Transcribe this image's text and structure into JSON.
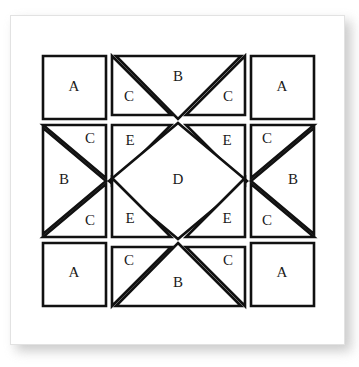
{
  "diagram": {
    "type": "quilt-block-pattern",
    "colors": {
      "background": "#ffffff",
      "page_background": "#ffffff",
      "piece_fill": "#ffffff",
      "piece_outline": "#111111",
      "label_text": "#1a1a1a",
      "card_border": "#e2e2e2",
      "shadow": "#b9b9b9"
    },
    "stroke_width": 2.6,
    "canvas": {
      "width": 335,
      "height": 330
    },
    "legend_letters": [
      "A",
      "B",
      "C",
      "D",
      "E"
    ],
    "piece_counts": {
      "A": 4,
      "B": 4,
      "C": 8,
      "D": 1,
      "E": 4
    },
    "pieces": [
      {
        "id": "a-top-left",
        "letter": "A",
        "shape": "square",
        "position": "top-left corner",
        "points": "32,40 95,40 95,103 32,103",
        "label_x": 63,
        "label_y": 72
      },
      {
        "id": "c-top-left",
        "letter": "C",
        "shape": "triangle",
        "position": "top row, left",
        "points": "101,40 160,99 101,99",
        "label_x": 118,
        "label_y": 82
      },
      {
        "id": "b-top",
        "letter": "B",
        "shape": "triangle",
        "position": "top row, center",
        "points": "105,40 230,40 167,103",
        "label_x": 167,
        "label_y": 62
      },
      {
        "id": "c-top-right",
        "letter": "C",
        "shape": "triangle",
        "position": "top row, right",
        "points": "234,40 234,99 175,99",
        "label_x": 217,
        "label_y": 82
      },
      {
        "id": "a-top-right",
        "letter": "A",
        "shape": "square",
        "position": "top-right corner",
        "points": "240,40 303,40 303,103 240,103",
        "label_x": 271,
        "label_y": 72
      },
      {
        "id": "c-left-upper",
        "letter": "C",
        "shape": "triangle",
        "position": "left column, upper",
        "points": "32,109 95,109 95,162",
        "label_x": 79,
        "label_y": 124
      },
      {
        "id": "b-left",
        "letter": "B",
        "shape": "triangle",
        "position": "left column, center",
        "points": "32,112 95,165 32,218",
        "label_x": 53,
        "label_y": 165
      },
      {
        "id": "c-left-lower",
        "letter": "C",
        "shape": "triangle",
        "position": "left column, lower",
        "points": "32,221 95,168 95,221",
        "label_x": 79,
        "label_y": 206
      },
      {
        "id": "e-upper-left",
        "letter": "E",
        "shape": "triangle",
        "position": "center, upper-left",
        "points": "101,109 160,109 101,168",
        "label_x": 119,
        "label_y": 126
      },
      {
        "id": "e-upper-right",
        "letter": "E",
        "shape": "triangle",
        "position": "center, upper-right",
        "points": "175,109 234,109 234,168",
        "label_x": 216,
        "label_y": 126
      },
      {
        "id": "d-center",
        "letter": "D",
        "shape": "diamond",
        "position": "center",
        "points": "167,107 236,165 167,223 98,165",
        "label_x": 167,
        "label_y": 165
      },
      {
        "id": "e-lower-left",
        "letter": "E",
        "shape": "triangle",
        "position": "center, lower-left",
        "points": "101,162 101,221 160,221",
        "label_x": 119,
        "label_y": 204
      },
      {
        "id": "e-lower-right",
        "letter": "E",
        "shape": "triangle",
        "position": "center, lower-right",
        "points": "234,162 234,221 175,221",
        "label_x": 216,
        "label_y": 204
      },
      {
        "id": "c-right-upper",
        "letter": "C",
        "shape": "triangle",
        "position": "right column, upper",
        "points": "240,109 303,109 240,162",
        "label_x": 256,
        "label_y": 124
      },
      {
        "id": "b-right",
        "letter": "B",
        "shape": "triangle",
        "position": "right column, center",
        "points": "303,112 303,218 240,165",
        "label_x": 282,
        "label_y": 165
      },
      {
        "id": "c-right-lower",
        "letter": "C",
        "shape": "triangle",
        "position": "right column, lower",
        "points": "240,168 303,221 240,221",
        "label_x": 256,
        "label_y": 206
      },
      {
        "id": "a-bottom-left",
        "letter": "A",
        "shape": "square",
        "position": "bottom-left corner",
        "points": "32,227 95,227 95,290 32,290",
        "label_x": 63,
        "label_y": 258
      },
      {
        "id": "c-bottom-left",
        "letter": "C",
        "shape": "triangle",
        "position": "bottom row, left",
        "points": "101,231 101,290 160,231",
        "label_x": 118,
        "label_y": 246
      },
      {
        "id": "b-bottom",
        "letter": "B",
        "shape": "triangle",
        "position": "bottom row, center",
        "points": "167,227 230,290 105,290",
        "label_x": 167,
        "label_y": 268
      },
      {
        "id": "c-bottom-right",
        "letter": "C",
        "shape": "triangle",
        "position": "bottom row, right",
        "points": "175,231 234,231 234,290",
        "label_x": 217,
        "label_y": 246
      },
      {
        "id": "a-bottom-right",
        "letter": "A",
        "shape": "square",
        "position": "bottom-right corner",
        "points": "240,227 303,227 303,290 240,290",
        "label_x": 271,
        "label_y": 258
      }
    ]
  }
}
